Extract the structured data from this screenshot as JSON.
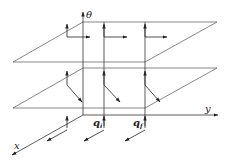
{
  "diagram": {
    "type": "3d-coordinate-planes",
    "axes": {
      "theta_label": "θ",
      "y_label": "y",
      "x_label": "x"
    },
    "points": {
      "q_initial": "q",
      "q_initial_sub": "i",
      "q_final": "q",
      "q_final_sub": "f"
    },
    "planes": [
      {
        "name": "upper-plane",
        "description": "horizontal plane with arrows along y direction"
      },
      {
        "name": "lower-plane",
        "description": "horizontal plane with arrows along diagonal direction"
      }
    ],
    "colors": {
      "line": "#333333",
      "background": "#ffffff"
    }
  }
}
